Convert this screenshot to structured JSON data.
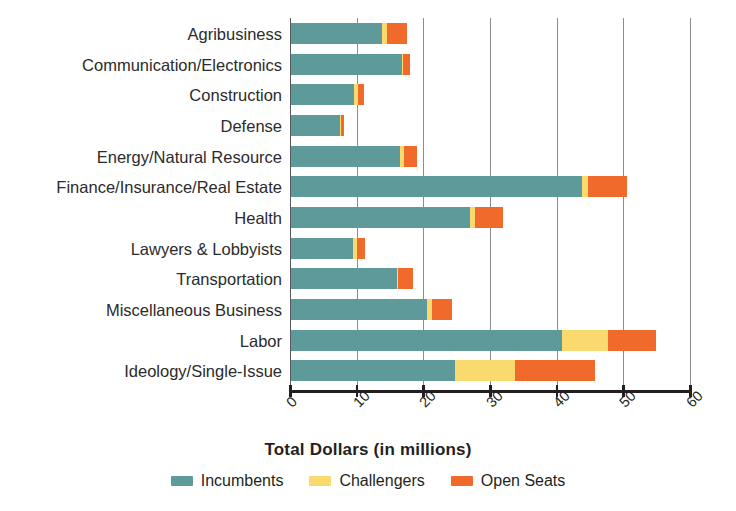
{
  "chart_data": {
    "type": "bar",
    "orientation": "horizontal",
    "stacked": true,
    "title": "",
    "xlabel": "Total Dollars (in millions)",
    "ylabel": "",
    "xlim": [
      0,
      60
    ],
    "xticks": [
      0,
      10,
      20,
      30,
      40,
      50,
      60
    ],
    "xtick_labels": [
      "0",
      "10",
      "20",
      "30",
      "40",
      "50",
      "60"
    ],
    "grid": "vertical",
    "legend_position": "bottom-center",
    "categories": [
      "Agribusiness",
      "Communication/Electronics",
      "Construction",
      "Defense",
      "Energy/Natural Resource",
      "Finance/Insurance/Real Estate",
      "Health",
      "Lawyers & Lobbyists",
      "Transportation",
      "Miscellaneous Business",
      "Labor",
      "Ideology/Single-Issue"
    ],
    "series": [
      {
        "name": "Incumbents",
        "color": "#5f9a9a",
        "values": [
          13.8,
          16.8,
          9.6,
          7.5,
          16.5,
          43.8,
          27.0,
          9.5,
          16.0,
          20.6,
          40.8,
          24.7
        ]
      },
      {
        "name": "Challengers",
        "color": "#fad96f",
        "values": [
          0.8,
          0.2,
          0.6,
          0.1,
          0.6,
          0.9,
          0.7,
          0.6,
          0.2,
          0.7,
          6.9,
          9.1
        ]
      },
      {
        "name": "Open Seats",
        "color": "#ef6a2b",
        "values": [
          2.9,
          1.0,
          0.9,
          0.5,
          1.9,
          5.8,
          4.2,
          1.1,
          2.3,
          3.0,
          7.2,
          11.9
        ]
      }
    ],
    "totals": [
      17.5,
      18.0,
      11.1,
      8.1,
      19.0,
      50.5,
      31.9,
      11.2,
      18.5,
      24.3,
      54.9,
      45.7
    ]
  },
  "legend": {
    "items": [
      {
        "label": "Incumbents",
        "color": "#5f9a9a",
        "swatch_name": "legend-swatch-incumbents"
      },
      {
        "label": "Challengers",
        "color": "#fad96f",
        "swatch_name": "legend-swatch-challengers"
      },
      {
        "label": "Open Seats",
        "color": "#ef6a2b",
        "swatch_name": "legend-swatch-openseats"
      }
    ]
  }
}
